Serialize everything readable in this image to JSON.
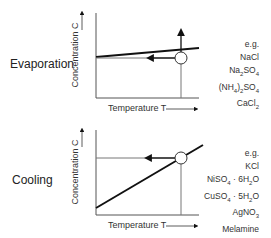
{
  "panels": [
    {
      "title": "Evaporation",
      "y_axis_label": "Concentration C",
      "x_axis_label": "Temperature T",
      "examples_header": "e.g.",
      "examples": [
        "NaCl",
        "Na2SO4",
        "(NH4)2SO4",
        "CaCl2"
      ],
      "curve": "nearly flat solubility curve",
      "process_arrows": [
        "horizontal arrow pointing left toward curve",
        "vertical arrow pointing up from operating point"
      ]
    },
    {
      "title": "Cooling",
      "y_axis_label": "Concentration C",
      "x_axis_label": "Temperature T",
      "examples_header": "e.g.",
      "examples": [
        "KCl",
        "NiSO4 · 6H2O",
        "CuSO4 · 5H2O",
        "AgNO3",
        "Melamine"
      ],
      "curve": "steep rising solubility curve",
      "process_arrows": [
        "horizontal arrow pointing left from operating point"
      ]
    }
  ]
}
